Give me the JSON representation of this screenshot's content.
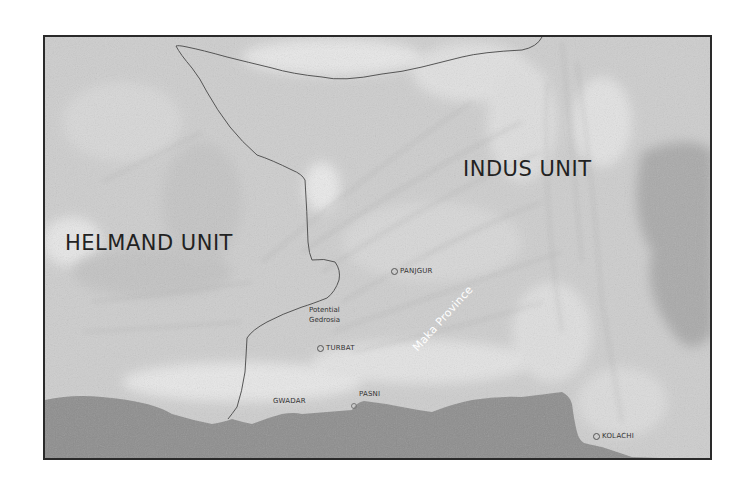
{
  "map": {
    "style": "grayscale shaded relief",
    "units": [
      {
        "id": "helmand",
        "label": "HELMAND UNIT"
      },
      {
        "id": "indus",
        "label": "INDUS UNIT"
      }
    ],
    "province": {
      "label": "Maka Province"
    },
    "region_note": {
      "line1": "Potential",
      "line2": "Gedrosia"
    },
    "cities": [
      {
        "id": "panjgur",
        "label": "PANJGUR",
        "marker": true
      },
      {
        "id": "turbat",
        "label": "TURBAT",
        "marker": true
      },
      {
        "id": "gwadar",
        "label": "GWADAR",
        "marker": false
      },
      {
        "id": "pasni",
        "label": "PASNI",
        "marker": true
      },
      {
        "id": "kolachi",
        "label": "KOLACHI",
        "marker": true
      }
    ],
    "colors": {
      "land": "#cfcfcf",
      "land_light": "#e6e6e6",
      "sea": "#8a8a8a",
      "border_line": "#555555",
      "frame": "#2a2a2a",
      "label_dark": "#222222",
      "label_light": "#ffffff"
    }
  }
}
